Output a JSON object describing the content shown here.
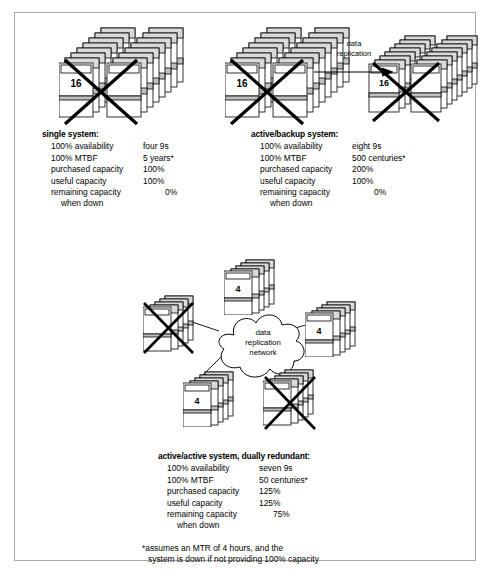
{
  "diagram": {
    "title_present": false,
    "top_left_stack": {
      "count_label": "16",
      "crossed_out": true,
      "unit_label": "processor"
    },
    "top_middle_stack": {
      "count_label": "16",
      "crossed_out": true,
      "unit_label": "processor"
    },
    "top_right_stack": {
      "count_label": "16",
      "crossed_out": true,
      "unit_label": "processor"
    },
    "replication_arrow": {
      "line1": "data",
      "line2": "replication"
    },
    "cloud": {
      "line1": "data",
      "line2": "replication",
      "line3": "network"
    },
    "center_nodes": [
      {
        "position": "top",
        "count_label": "4",
        "crossed_out": false,
        "unit_label": "processor"
      },
      {
        "position": "right",
        "count_label": "4",
        "crossed_out": false,
        "unit_label": "processor"
      },
      {
        "position": "left",
        "count_label": "4",
        "crossed_out": true,
        "unit_label": "processor"
      },
      {
        "position": "bottom-left",
        "count_label": "4",
        "crossed_out": false,
        "unit_label": "processor"
      },
      {
        "position": "bottom-right",
        "count_label": "4",
        "crossed_out": true,
        "unit_label": "processor"
      }
    ]
  },
  "single_system": {
    "title": "single system:",
    "rows": [
      {
        "label": "100% availability",
        "value": "four 9s"
      },
      {
        "label": "100% MTBF",
        "value": "5 years*"
      },
      {
        "label": "purchased capacity",
        "value": "100%"
      },
      {
        "label": "useful capacity",
        "value": "100%"
      },
      {
        "label": "remaining capacity",
        "value": "0%"
      }
    ],
    "continuation": "when down"
  },
  "active_backup_system": {
    "title": "active/backup system:",
    "rows": [
      {
        "label": "100% availability",
        "value": "eight 9s"
      },
      {
        "label": "100% MTBF",
        "value": "500 centuries*"
      },
      {
        "label": "purchased capacity",
        "value": "200%"
      },
      {
        "label": "useful capacity",
        "value": "100%"
      },
      {
        "label": "remaining capacity",
        "value": "0%"
      }
    ],
    "continuation": "when down"
  },
  "active_active_system": {
    "title": "active/active system, dually redundant:",
    "rows": [
      {
        "label": "100% availability",
        "value": "seven 9s"
      },
      {
        "label": "100% MTBF",
        "value": "50 centuries*"
      },
      {
        "label": "purchased capacity",
        "value": "125%"
      },
      {
        "label": "useful capacity",
        "value": "125%"
      },
      {
        "label": "remaining capacity",
        "value": "75%"
      }
    ],
    "continuation": "when down"
  },
  "footnote": {
    "line1": "*assumes an MTR of 4 hours, and the",
    "line2": "system is down if not providing 100% capacity"
  },
  "colors": {
    "border": "#a8a8a8",
    "stroke": "#000000",
    "box_fill": "#ffffff",
    "shade_fill": "#d9d9d9",
    "band_fill": "#bfbfbf"
  }
}
